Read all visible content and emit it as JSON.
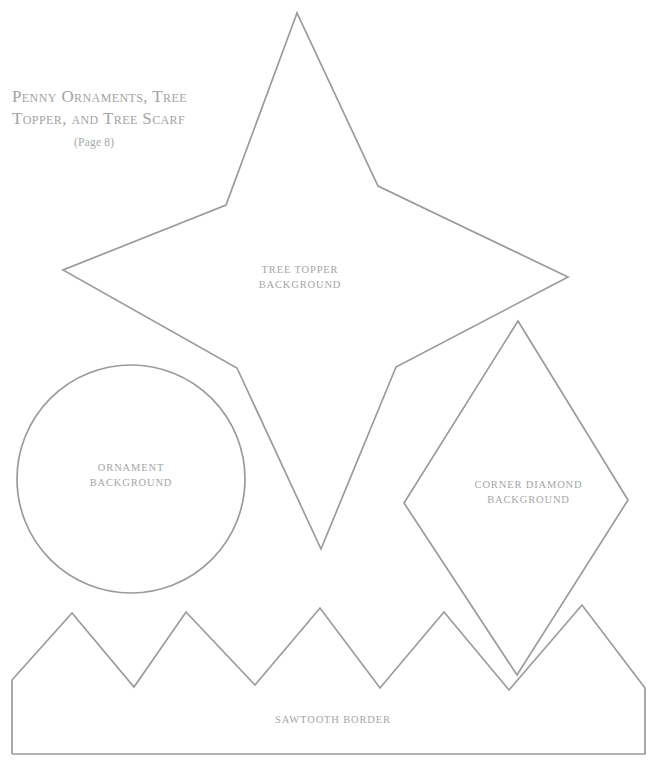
{
  "document": {
    "title_lines": [
      "Penny Ornaments, Tree",
      "Topper, and Tree Scarf"
    ],
    "page_note": "(Page 8)",
    "ink_color": "#9b9b9b",
    "text_color": "#a3a3a3",
    "background_color": "#ffffff"
  },
  "shapes": {
    "tree_topper": {
      "label_line1": "TREE TOPPER",
      "label_line2": "BACKGROUND",
      "outline_name": "five-point-star",
      "points": "297,13 226,205 63,270 237,368 321,549 396,367 568,277 378,186"
    },
    "ornament": {
      "label_line1": "ORNAMENT",
      "label_line2": "BACKGROUND",
      "outline_name": "circle",
      "cx": 131,
      "cy": 479,
      "r": 114
    },
    "corner_diamond": {
      "label_line1": "CORNER DIAMOND",
      "label_line2": "BACKGROUND",
      "outline_name": "diamond",
      "points": "518,321 628,500 517,675 404,503"
    },
    "sawtooth": {
      "label": "SAWTOOTH BORDER",
      "outline_name": "sawtooth-border",
      "points": "12,754 12,680 72,613 134,687 186,612 255,685 320,608 380,688 444,612 509,690 582,605 645,688 645,754 12,754"
    }
  }
}
